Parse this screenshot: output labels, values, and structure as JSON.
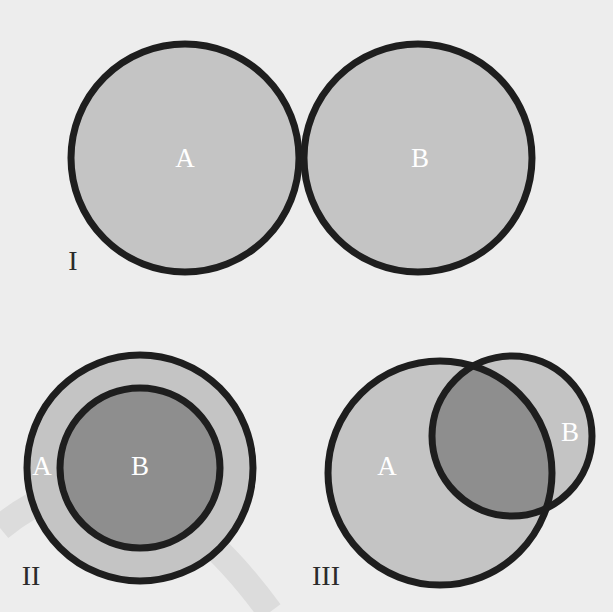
{
  "colors": {
    "background": "#ededed",
    "set_fill": "#c4c4c4",
    "intersection_fill": "#8e8e8e",
    "inner_fill": "#8e8e8e",
    "outline": "#1e1e1e",
    "watermark_arc": "#dcdcdc",
    "inner_label": "#ffffff",
    "panel_label": "#2a2a2a"
  },
  "panels": [
    {
      "id": "I",
      "numeral": "I",
      "relation": "disjoint",
      "sets": [
        {
          "label": "A"
        },
        {
          "label": "B"
        }
      ]
    },
    {
      "id": "II",
      "numeral": "II",
      "relation": "B subset of A",
      "sets": [
        {
          "label": "A"
        },
        {
          "label": "B"
        }
      ]
    },
    {
      "id": "III",
      "numeral": "III",
      "relation": "overlapping",
      "sets": [
        {
          "label": "A"
        },
        {
          "label": "B"
        }
      ]
    }
  ]
}
